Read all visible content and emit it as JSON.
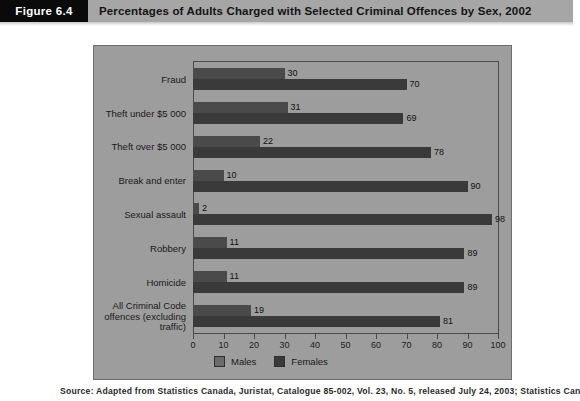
{
  "header": {
    "figure_tag": "Figure 6.4",
    "title": "Percentages of Adults Charged with Selected Criminal Offences by Sex, 2002"
  },
  "source_note": "Source: Adapted from Statistics Canada, Juristat, Catalogue 85-002, Vol. 23, No. 5, released July 24, 2003; Statistics Canada",
  "legend": {
    "males_label": "Males",
    "females_label": "Females",
    "males_color": "#6b6b6b",
    "females_color": "#3a3a3a"
  },
  "axis": {
    "ticks": [
      "0",
      "10",
      "20",
      "30",
      "40",
      "50",
      "60",
      "70",
      "80",
      "90",
      "100"
    ]
  },
  "chart_data": {
    "type": "bar",
    "orientation": "horizontal",
    "title": "Percentages of Adults Charged with Selected Criminal Offences by Sex, 2002",
    "xlabel": "",
    "ylabel": "",
    "xlim": [
      0,
      100
    ],
    "xticks": [
      0,
      10,
      20,
      30,
      40,
      50,
      60,
      70,
      80,
      90,
      100
    ],
    "grid": false,
    "legend_position": "bottom-left",
    "categories": [
      "Fraud",
      "Theft under $5 000",
      "Theft over $5 000",
      "Break and enter",
      "Sexual assault",
      "Robbery",
      "Homicide",
      "All Criminal Code\noffences (excluding\ntraffic)"
    ],
    "series": [
      {
        "name": "Males",
        "values": [
          30,
          31,
          22,
          10,
          2,
          11,
          11,
          19
        ]
      },
      {
        "name": "Females",
        "values": [
          70,
          69,
          78,
          90,
          98,
          89,
          89,
          81
        ]
      }
    ]
  }
}
